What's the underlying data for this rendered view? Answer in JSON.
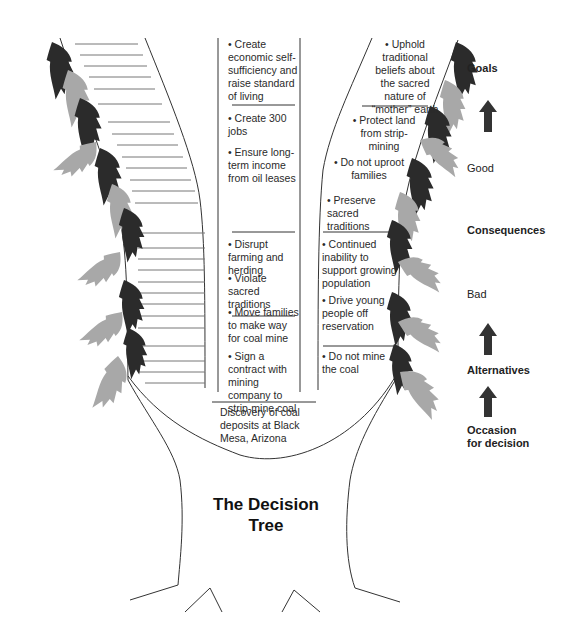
{
  "title": "The Decision\nTree",
  "occasion": "Discovery of coal deposits at Black Mesa, Arizona",
  "left_branch": {
    "goal": "• Create economic self-sufficiency and raise standard of living",
    "good_consequences": [
      "• Create 300 jobs",
      "• Ensure long-term income from oil leases"
    ],
    "bad_consequences": [
      "• Disrupt farming and herding",
      "• Violate sacred traditions",
      "• Move families to make way for coal mine"
    ],
    "alternative": "• Sign a contract with mining company to strip-mine coal"
  },
  "right_branch": {
    "goal": "• Uphold traditional beliefs about the sacred nature of “mother” earth",
    "good_consequences": [
      "• Protect land from strip-mining",
      "• Do not uproot families",
      "• Preserve sacred traditions"
    ],
    "bad_consequences": [
      "• Continued inability to support growing population",
      "• Drive young people off reservation"
    ],
    "alternative": "• Do not mine the coal"
  },
  "legend": {
    "goals": "Goals",
    "good": "Good",
    "consequences": "Consequences",
    "bad": "Bad",
    "alternatives": "Alternatives",
    "occasion": "Occasion\nfor decision"
  },
  "colors": {
    "dark_leaf": "#2b2b2b",
    "light_leaf": "#a8a8a8",
    "line": "#333333"
  }
}
